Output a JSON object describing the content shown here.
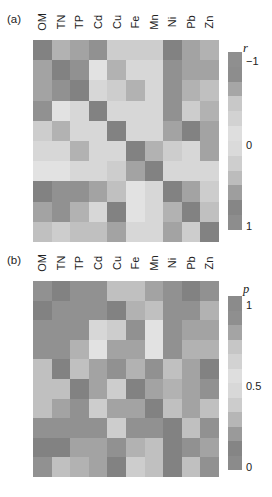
{
  "figure_background": "#ffffff",
  "chart_data": [
    {
      "type": "heatmap",
      "panel_label": "(a)",
      "measure": "r",
      "x_labels": [
        "OM",
        "TN",
        "TP",
        "Cd",
        "Cu",
        "Fe",
        "Mn",
        "Ni",
        "Pb",
        "Zn"
      ],
      "rows_follow_same_order_as_columns": true,
      "colorbar": {
        "label": "r",
        "orientation": "vertical",
        "ticks": [
          {
            "label": "−1",
            "pos": 0.05
          },
          {
            "label": "0",
            "pos": 0.52
          },
          {
            "label": "1",
            "pos": 0.98
          }
        ],
        "segment_colors_top_to_bottom": [
          "#8f8f8f",
          "#8d8d8d",
          "#a6a6a6",
          "#c8c8c8",
          "#d2d2d2",
          "#dedede",
          "#dadada",
          "#cecece",
          "#bcbcbc",
          "#9e9e9e",
          "#868686",
          "#8d8d8d"
        ]
      },
      "level_scale_note": "0 = lightest gray (r near 0), 7 = darkest gray (|r| near 1)",
      "level_to_color": [
        "#e2e2e2",
        "#d7d7d7",
        "#cdcdcd",
        "#c0c0c0",
        "#b2b2b2",
        "#a3a3a3",
        "#919191",
        "#828282"
      ],
      "gray_levels": [
        [
          7,
          4,
          5,
          6,
          2,
          2,
          2,
          7,
          5,
          4
        ],
        [
          5,
          7,
          6,
          0,
          4,
          1,
          1,
          6,
          5,
          5
        ],
        [
          5,
          6,
          7,
          1,
          2,
          4,
          1,
          6,
          4,
          3
        ],
        [
          6,
          0,
          1,
          7,
          1,
          1,
          1,
          6,
          2,
          4
        ],
        [
          2,
          4,
          1,
          1,
          7,
          1,
          1,
          5,
          7,
          5
        ],
        [
          1,
          1,
          4,
          1,
          1,
          7,
          4,
          2,
          1,
          5
        ],
        [
          0,
          0,
          1,
          1,
          2,
          5,
          7,
          1,
          1,
          1
        ],
        [
          7,
          6,
          6,
          5,
          3,
          0,
          1,
          7,
          5,
          2
        ],
        [
          5,
          6,
          4,
          1,
          7,
          0,
          1,
          4,
          7,
          3
        ],
        [
          3,
          2,
          3,
          3,
          5,
          1,
          1,
          5,
          2,
          7
        ]
      ]
    },
    {
      "type": "heatmap",
      "panel_label": "(b)",
      "measure": "p",
      "x_labels": [
        "OM",
        "TN",
        "TP",
        "Cd",
        "Cu",
        "Fe",
        "Mn",
        "Ni",
        "Pb",
        "Zn"
      ],
      "rows_follow_same_order_as_columns": true,
      "colorbar": {
        "label": "p",
        "orientation": "vertical",
        "ticks": [
          {
            "label": "1",
            "pos": 0.05
          },
          {
            "label": "0.5",
            "pos": 0.52
          },
          {
            "label": "0",
            "pos": 0.985
          }
        ],
        "segment_colors_top_to_bottom": [
          "#8b8b8b",
          "#8f8f8f",
          "#a4a4a4",
          "#c6c6c6",
          "#d2d2d2",
          "#dedede",
          "#d8d8d8",
          "#cccccc",
          "#b6b6b6",
          "#9a9a9a",
          "#858585",
          "#8b8b8b"
        ]
      },
      "level_scale_note": "0 = lightest gray (p near 0.5), 7 = darkest gray (p near 0 or 1)",
      "level_to_color": [
        "#e2e2e2",
        "#d7d7d7",
        "#cdcdcd",
        "#c0c0c0",
        "#b2b2b2",
        "#a3a3a3",
        "#919191",
        "#828282"
      ],
      "gray_levels": [
        [
          6,
          7,
          6,
          6,
          3,
          3,
          5,
          6,
          7,
          6
        ],
        [
          7,
          6,
          6,
          6,
          7,
          4,
          3,
          6,
          6,
          4
        ],
        [
          6,
          6,
          6,
          1,
          2,
          6,
          0,
          6,
          5,
          5
        ],
        [
          6,
          6,
          4,
          0,
          5,
          5,
          0,
          6,
          4,
          4
        ],
        [
          3,
          7,
          3,
          5,
          6,
          4,
          6,
          3,
          5,
          7
        ],
        [
          3,
          3,
          7,
          5,
          2,
          7,
          5,
          4,
          5,
          6
        ],
        [
          3,
          5,
          6,
          2,
          5,
          5,
          7,
          3,
          5,
          3
        ],
        [
          6,
          6,
          6,
          6,
          2,
          6,
          6,
          7,
          3,
          6
        ],
        [
          7,
          7,
          5,
          5,
          6,
          4,
          3,
          7,
          6,
          5
        ],
        [
          6,
          3,
          4,
          5,
          7,
          2,
          3,
          7,
          3,
          6
        ]
      ]
    }
  ]
}
